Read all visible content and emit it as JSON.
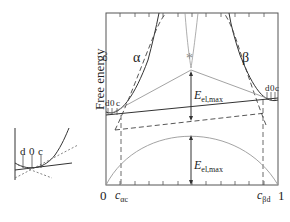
{
  "figure": {
    "y_axis_label": "Free energy",
    "phase_alpha": "α",
    "phase_beta": "β",
    "star": "*",
    "points_left": [
      "d",
      "0",
      "c"
    ],
    "points_right": [
      "d",
      "0",
      "c"
    ],
    "emax_upper": {
      "main": "E",
      "sub": "el,max"
    },
    "emax_lower": {
      "main": "E",
      "sub": "el,max"
    },
    "x_ticks": {
      "zero": "0",
      "c_alpha": {
        "main": "c",
        "sub": "αc"
      },
      "c_beta": {
        "main": "c",
        "sub": "βd"
      },
      "one": "1"
    },
    "inset_labels": [
      "d",
      "0",
      "c"
    ]
  },
  "colors": {
    "line": "#333333",
    "gray": "#999999",
    "background": "#ffffff"
  }
}
